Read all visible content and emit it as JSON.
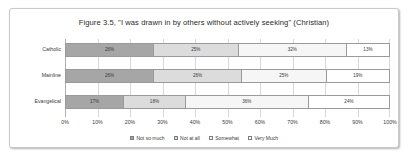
{
  "chart_data": {
    "type": "bar",
    "subtype": "stacked-horizontal-100pct",
    "title": "Figure 3.5, \"I was drawn in by others without actively seeking\" (Christian)",
    "xlabel": "",
    "ylabel": "",
    "xlim": [
      0,
      100
    ],
    "xticks": [
      "0%",
      "10%",
      "20%",
      "30%",
      "40%",
      "50%",
      "60%",
      "70%",
      "80%",
      "90%",
      "100%"
    ],
    "grid": true,
    "legend_position": "bottom",
    "categories": [
      "Catholic",
      "Mainline",
      "Evangelical"
    ],
    "series": [
      {
        "name": "Not so much",
        "color": "#a6a6a6",
        "values": [
          26,
          26,
          17
        ],
        "labels": [
          "26%",
          "26%",
          "17%"
        ]
      },
      {
        "name": "Not at all",
        "color": "#dcdcdc",
        "values": [
          25,
          26,
          18
        ],
        "labels": [
          "25%",
          "26%",
          "18%"
        ]
      },
      {
        "name": "Somewhat",
        "color": "#f6f6f6",
        "values": [
          32,
          25,
          36
        ],
        "labels": [
          "32%",
          "25%",
          "36%"
        ]
      },
      {
        "name": "Very Much",
        "color": "#ffffff",
        "values": [
          13,
          19,
          24
        ],
        "labels": [
          "13%",
          "19%",
          "24%"
        ]
      }
    ]
  }
}
